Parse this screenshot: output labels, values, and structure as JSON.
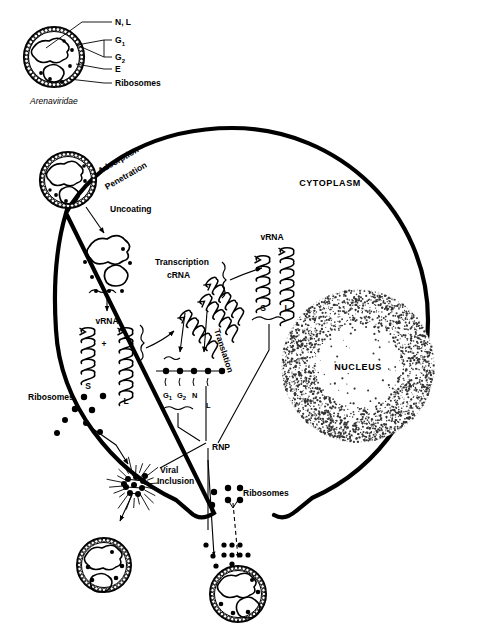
{
  "figure": {
    "title_inset": "Arenaviridae",
    "cell_compartments": {
      "cytoplasm": "CYTOPLASM",
      "nucleus": "NUCLEUS"
    }
  },
  "inset_virion": {
    "name": "Arenaviridae",
    "callouts": [
      {
        "id": "nl",
        "label": "N, L",
        "target": "nucleocapsid"
      },
      {
        "id": "g1",
        "label": "G",
        "sub": "1",
        "target": "glycoprotein-1"
      },
      {
        "id": "g2",
        "label": "G",
        "sub": "2",
        "target": "glycoprotein-2"
      },
      {
        "id": "e",
        "label": "E",
        "target": "envelope"
      },
      {
        "id": "ribosomes",
        "label": "Ribosomes",
        "target": "ribosomes"
      }
    ]
  },
  "steps": [
    {
      "id": "adsorption",
      "label": "Adsorption"
    },
    {
      "id": "penetration",
      "label": "Penetration"
    },
    {
      "id": "uncoating",
      "label": "Uncoating"
    },
    {
      "id": "transcription",
      "label": "Transcription"
    },
    {
      "id": "translation",
      "label": "Translation"
    }
  ],
  "molecules": {
    "vrna_released": "vRNA",
    "vrna_progeny": "vRNA",
    "crna": "cRNA",
    "segment_s": "S",
    "segment_l": "L",
    "plus_sign": "+",
    "rnp": "RNP",
    "viral_inclusion_line1": "Viral",
    "viral_inclusion_line2": "Inclusion",
    "ribosomes_left": "Ribosomes",
    "ribosomes_right": "Ribosomes"
  },
  "polysome": {
    "ribosome_count": 5,
    "products": [
      {
        "label": "G",
        "sub": "1"
      },
      {
        "label": "G",
        "sub": "2"
      },
      {
        "label": "N",
        "sub": ""
      },
      {
        "label": "L",
        "sub": ""
      }
    ]
  },
  "segment_pairs": {
    "released_vrna": [
      "S",
      "L"
    ],
    "progeny_vrna": [
      "S",
      "L"
    ]
  },
  "colors": {
    "ink": "#000000",
    "background": "#ffffff",
    "stipple": "#333333"
  }
}
